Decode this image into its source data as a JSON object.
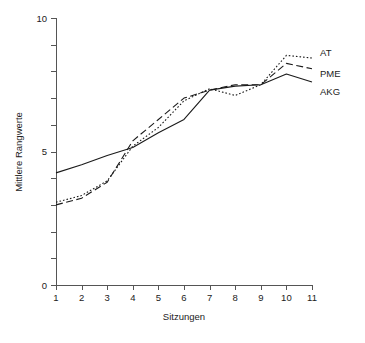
{
  "chart_data": {
    "type": "line",
    "title": "",
    "subtitle": "",
    "xlabel": "Sitzungen",
    "ylabel": "Mittlere Rangwerte",
    "x": [
      1,
      2,
      3,
      4,
      5,
      6,
      7,
      8,
      9,
      10,
      11
    ],
    "categories": [
      "1",
      "2",
      "3",
      "4",
      "5",
      "6",
      "7",
      "8",
      "9",
      "10",
      "11"
    ],
    "xlim": [
      1,
      11
    ],
    "ylim": [
      0,
      10
    ],
    "x_ticks": [
      1,
      2,
      3,
      4,
      5,
      6,
      7,
      8,
      9,
      10,
      11
    ],
    "x_tick_labels": [
      "1",
      "2",
      "3",
      "4",
      "5",
      "6",
      "7",
      "8",
      "9",
      "10",
      "11"
    ],
    "y_ticks": [
      0,
      1,
      2,
      3,
      4,
      5,
      6,
      7,
      8,
      9,
      10
    ],
    "y_tick_labels": [
      "0",
      "",
      "",
      "",
      "",
      "5",
      "",
      "",
      "",
      "",
      "10"
    ],
    "y_labeled_ticks": [
      {
        "value": 0,
        "label": "0"
      },
      {
        "value": 5,
        "label": "5"
      },
      {
        "value": 10,
        "label": "10"
      }
    ],
    "grid": false,
    "legend_position": "right-inline",
    "series": [
      {
        "name": "AT",
        "style": "dotted",
        "color": "#1a1a1a",
        "values": [
          3.1,
          3.35,
          3.9,
          5.2,
          5.9,
          6.9,
          7.35,
          7.1,
          7.5,
          8.6,
          8.5
        ]
      },
      {
        "name": "PME",
        "style": "dashed",
        "color": "#1a1a1a",
        "values": [
          3.0,
          3.25,
          3.85,
          5.4,
          6.2,
          7.0,
          7.3,
          7.5,
          7.5,
          8.3,
          8.1
        ]
      },
      {
        "name": "AKG",
        "style": "solid",
        "color": "#1a1a1a",
        "values": [
          4.2,
          4.5,
          4.85,
          5.15,
          5.7,
          6.2,
          7.3,
          7.45,
          7.5,
          7.9,
          7.6
        ]
      }
    ],
    "annotations": []
  },
  "axes": {
    "x_title": "Sitzungen",
    "y_title": "Mittlere Rangwerte"
  },
  "legend": {
    "entries": [
      {
        "label": "AT"
      },
      {
        "label": "PME"
      },
      {
        "label": "AKG"
      }
    ]
  },
  "colors": {
    "line": "#1a1a1a",
    "axis": "#555555",
    "text": "#222222",
    "background": "#ffffff"
  }
}
